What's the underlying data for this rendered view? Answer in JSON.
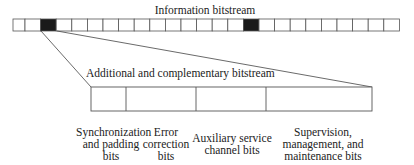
{
  "diagram": {
    "info_stream": {
      "title": "Information bitstream",
      "cell_count": 25,
      "highlighted_cells": [
        2,
        15
      ],
      "highlight_color": "#1a1a1a"
    },
    "additional_stream": {
      "title": "Additional and complementary bitstream",
      "segments": [
        {
          "label": "Synchronization\nand padding\nbits"
        },
        {
          "label": "Error\ncorrection\nbits"
        },
        {
          "label": "Auxiliary service\nchannel bits"
        },
        {
          "label": "Supervision,\nmanagement, and\nmaintenance bits"
        }
      ]
    },
    "line_color": "#555555"
  }
}
